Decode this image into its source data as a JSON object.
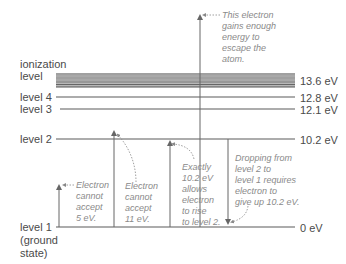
{
  "diagram": {
    "type": "energy-level-diagram",
    "levels": [
      {
        "id": "ionization",
        "label_line1": "ionization",
        "label_line2": "level",
        "energy": "13.6 eV"
      },
      {
        "id": "level4",
        "label": "level 4",
        "energy": "12.8 eV"
      },
      {
        "id": "level3",
        "label": "level 3",
        "energy": "12.1 eV"
      },
      {
        "id": "level2",
        "label": "level 2",
        "energy": "10.2 eV"
      },
      {
        "id": "level1",
        "label_line1": "level 1",
        "label_line2": "(ground",
        "label_line3": "state)",
        "energy": "0 eV"
      }
    ],
    "annotations": {
      "escape": [
        "This electron",
        "gains enough",
        "energy to",
        "escape the",
        "atom."
      ],
      "five_ev": [
        "Electron",
        "cannot",
        "accept",
        "5 eV."
      ],
      "eleven_ev": [
        "Electron",
        "cannot",
        "accept",
        "11 eV."
      ],
      "exact": [
        "Exactly",
        "10.2 eV",
        "allows",
        "electron",
        "to rise",
        "to level 2."
      ],
      "drop": [
        "Dropping from",
        "level 2 to",
        "level 1 requires",
        "electron to",
        "give up 10.2 eV."
      ]
    },
    "colors": {
      "line": "#5a5a5a",
      "band": "#8c8c8c",
      "text": "#4a4a4a",
      "annotation": "#8a8a8a"
    }
  }
}
